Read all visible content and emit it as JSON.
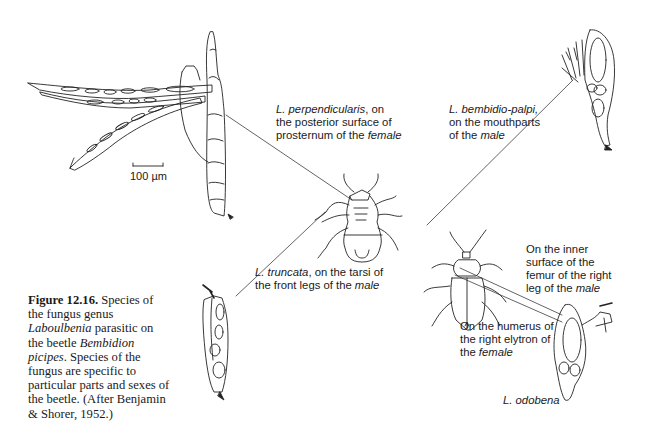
{
  "figure": {
    "number": "Figure 12.16.",
    "caption": {
      "part1": " Species of the fungus genus ",
      "genus": "Laboulbenia",
      "part2": " parasitic on the beetle ",
      "host": "Bembidion picipes",
      "part3": ". Species of the fungus are specific to particular parts and sexes of the beetle. (After Benjamin & Shorer, 1952.)"
    },
    "scale_bar": "100 µm",
    "labels": {
      "perpendicularis": {
        "species": "L. perpendicularis",
        "line1_rest": ", on",
        "line2": "the posterior surface of",
        "line3_pre": "prosternum of the ",
        "sex": "female"
      },
      "bembidio_palpi": {
        "species": "L. bembidio-palpi,",
        "line2": "on the mouthparts",
        "line3_pre": "of the ",
        "sex": "male"
      },
      "truncata": {
        "species": "L. truncata",
        "line1_rest": ", on the tarsi of",
        "line2_pre": "the front legs of the ",
        "sex": "male"
      },
      "inner_femur": {
        "line1": "On the inner",
        "line2": "surface of the",
        "line3": "femur of the right",
        "line4_pre": "leg of the ",
        "sex": "male"
      },
      "humerus": {
        "line1": "On the humerus of",
        "line2": "the right elytron of",
        "line3_pre": "the ",
        "sex": "female"
      },
      "odobena": {
        "species": "L. odobena"
      }
    }
  }
}
